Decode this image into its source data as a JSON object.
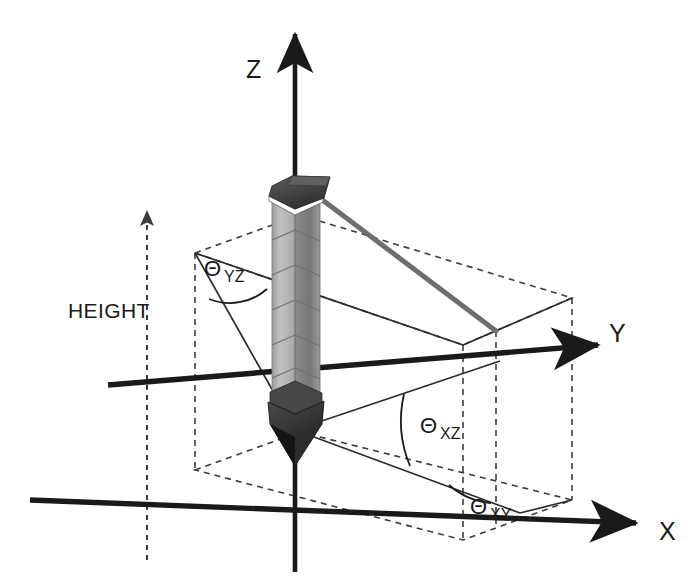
{
  "figure": {
    "background_color": "#ffffff"
  },
  "axes": [
    {
      "name": "z-axis",
      "label": "Z",
      "label_x": 246,
      "label_y": 78
    },
    {
      "name": "y-axis",
      "label": "Y",
      "label_x": 609,
      "label_y": 342
    },
    {
      "name": "x-axis",
      "label": "X",
      "label_x": 659,
      "label_y": 540
    }
  ],
  "angles": [
    {
      "name": "theta-yz",
      "symbol": "Θ",
      "subscript": "YZ",
      "label_x": 204,
      "label_y": 276,
      "sub_x": 224,
      "sub_y": 282
    },
    {
      "name": "theta-xz",
      "symbol": "Θ",
      "subscript": "XZ",
      "label_x": 420,
      "label_y": 433,
      "sub_x": 440,
      "sub_y": 439
    },
    {
      "name": "theta-xy",
      "symbol": "Θ",
      "subscript": "XY",
      "label_x": 470,
      "label_y": 514,
      "sub_x": 490,
      "sub_y": 520
    }
  ],
  "annotations": [
    {
      "name": "height-label",
      "text": "HEIGHT",
      "x": 68,
      "y": 318
    }
  ],
  "colors": {
    "axis_stroke": "#1a1a1a",
    "dashed_stroke": "#3c3c3c",
    "thin_stroke": "#2b2b2b",
    "tether_stroke": "#6e6e6e",
    "tower_light_face": "#b9b9b9",
    "tower_dark_face": "#8d8d8d",
    "tower_cap": "#4a4a4a",
    "tower_base": "#3a3a3a",
    "text": "#1a1a1a"
  },
  "geometry": {
    "origin": {
      "x": 295,
      "y": 430
    },
    "tower_top": {
      "x": 295,
      "y": 178
    },
    "tether_end": {
      "x": 496,
      "y": 331
    },
    "top_plane_corners": [
      {
        "x": 195,
        "y": 253
      },
      {
        "x": 300,
        "y": 215
      },
      {
        "x": 572,
        "y": 298
      },
      {
        "x": 463,
        "y": 345
      }
    ],
    "bottom_plane_corners": [
      {
        "x": 195,
        "y": 470
      },
      {
        "x": 300,
        "y": 432
      },
      {
        "x": 572,
        "y": 500
      },
      {
        "x": 463,
        "y": 540
      }
    ]
  }
}
